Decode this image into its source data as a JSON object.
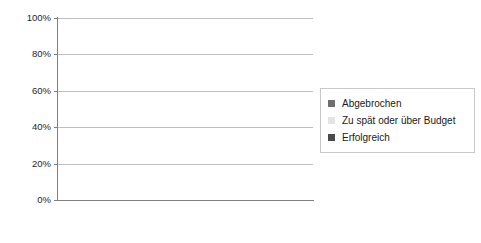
{
  "chart_data": {
    "type": "bar",
    "stacked": true,
    "title": "",
    "xlabel": "",
    "ylabel": "",
    "ylim": [
      0,
      100
    ],
    "ytick_labels": [
      "100%",
      "80%",
      "60%",
      "40%",
      "20%",
      "0%"
    ],
    "ytick_values": [
      100,
      80,
      60,
      40,
      20,
      0
    ],
    "grid": true,
    "legend_position": "right",
    "categories": [
      "1994",
      "1996",
      "1998",
      "2000",
      "2002",
      "2004",
      "2006",
      "2008",
      "2010"
    ],
    "series": [
      {
        "name": "Erfolgreich",
        "color": "#4a4a4a",
        "stack_position": "bottom",
        "values": [
          16,
          27,
          26,
          28,
          34,
          29,
          35,
          32,
          37
        ]
      },
      {
        "name": "Zu spät oder über Budget",
        "color": "#e4e4e4",
        "stack_position": "middle",
        "values": [
          53,
          33,
          46,
          49,
          51,
          53,
          46,
          44,
          42
        ]
      },
      {
        "name": "Abgebrochen",
        "color": "#6e6e6e",
        "stack_position": "top",
        "values": [
          31,
          40,
          28,
          23,
          15,
          18,
          19,
          24,
          21
        ]
      }
    ],
    "legend_entries": [
      {
        "label": "Abgebrochen",
        "color": "#6e6e6e"
      },
      {
        "label": "Zu spät oder über Budget",
        "color": "#e4e4e4"
      },
      {
        "label": "Erfolgreich",
        "color": "#4a4a4a"
      }
    ]
  }
}
